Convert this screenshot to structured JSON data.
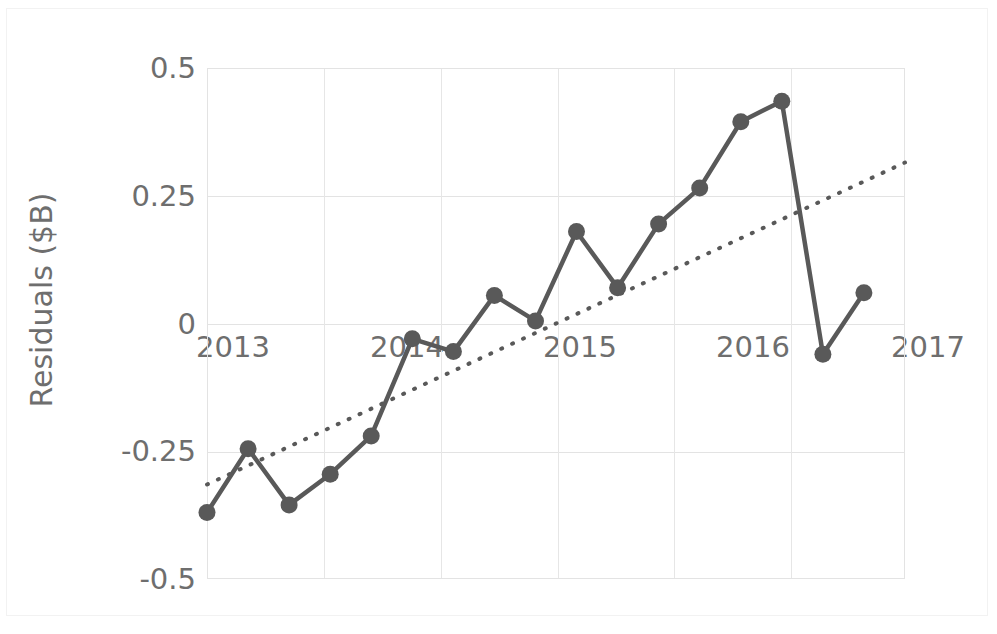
{
  "chart_data": {
    "type": "line",
    "title": "",
    "xlabel": "",
    "ylabel": "Residuals ($B)",
    "ylim": [
      -0.5,
      0.5
    ],
    "xlim": [
      2013.0,
      2017.25
    ],
    "grid": true,
    "legend": "none",
    "y_ticks": [
      "0.5",
      "0.25",
      "0",
      "-0.25",
      "-0.5"
    ],
    "y_tick_values": [
      0.5,
      0.25,
      0,
      -0.25,
      -0.5
    ],
    "x_ticks": [
      "2013",
      "2014",
      "2015",
      "2016",
      "2017"
    ],
    "x_tick_values": [
      2013,
      2014,
      2015,
      2016,
      2017
    ],
    "series": [
      {
        "name": "Residuals",
        "style": "line-with-markers",
        "color": "#595959",
        "x": [
          2013.0,
          2013.25,
          2013.5,
          2013.75,
          2014.0,
          2014.25,
          2014.5,
          2014.75,
          2015.0,
          2015.25,
          2015.5,
          2015.75,
          2016.0,
          2016.25,
          2016.5,
          2016.75,
          2017.0
        ],
        "values": [
          -0.37,
          -0.245,
          -0.355,
          -0.295,
          -0.22,
          -0.03,
          -0.055,
          0.055,
          0.005,
          0.18,
          0.07,
          0.195,
          0.265,
          0.395,
          0.435,
          -0.06,
          0.06
        ]
      },
      {
        "name": "Trendline",
        "style": "dotted",
        "color": "#595959",
        "x": [
          2013.0,
          2017.25
        ],
        "values": [
          -0.315,
          0.315
        ]
      }
    ]
  },
  "axis": {
    "y_title": "Residuals ($B)",
    "y_labels": [
      "0.5",
      "0.25",
      "0",
      "-0.25",
      "-0.5"
    ],
    "x_labels": [
      "2013",
      "2014",
      "2015",
      "2016",
      "2017"
    ]
  },
  "colors": {
    "series": "#595959",
    "trendline": "#595959",
    "grid": "#e3e3e3",
    "axis_text": "#6e6e6e",
    "background": "#ffffff"
  }
}
